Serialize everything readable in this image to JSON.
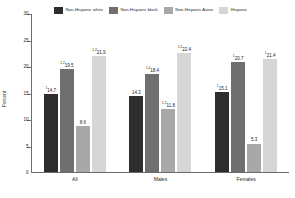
{
  "chart_data": {
    "type": "bar",
    "title": "",
    "xlabel": "",
    "ylabel": "Percent",
    "ylim": [
      0,
      30
    ],
    "yticks": [
      "0",
      "5",
      "10",
      "15",
      "20",
      "25",
      "30"
    ],
    "grid": false,
    "legend_position": "top",
    "categories": [
      "All",
      "Males",
      "Females"
    ],
    "series": [
      {
        "name": "Non-Hispanic white",
        "color": "#2d2d2d",
        "values": [
          14.7,
          14.3,
          15.1
        ],
        "labels": [
          "14.7",
          "14.3",
          "15.1"
        ],
        "footnotes": [
          "1",
          "",
          "1"
        ]
      },
      {
        "name": "Non-Hispanic black",
        "color": "#6f6f6f",
        "values": [
          19.5,
          18.4,
          20.7
        ],
        "labels": [
          "19.5",
          "18.4",
          "20.7"
        ],
        "footnotes": [
          "1,2",
          "1,2",
          "1"
        ]
      },
      {
        "name": "Non-Hispanic Asian",
        "color": "#a8a8a8",
        "values": [
          8.6,
          11.8,
          5.3
        ],
        "labels": [
          "8.6",
          "11.8",
          "5.3"
        ],
        "footnotes": [
          "",
          "1,2",
          ""
        ]
      },
      {
        "name": "Hispanic",
        "color": "#d6d6d6",
        "values": [
          21.9,
          22.4,
          21.4
        ],
        "labels": [
          "21.9",
          "22.4",
          "21.4"
        ],
        "footnotes": [
          "1,2",
          "1,2",
          "1"
        ]
      }
    ]
  }
}
